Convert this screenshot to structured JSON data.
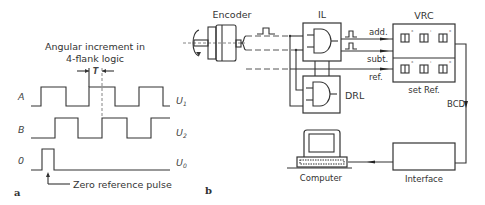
{
  "panel_a": {
    "label": "a",
    "title_line1": "Angular increment in",
    "title_line2": "4-flank logic",
    "period_label": "T",
    "signals": [
      {
        "name": "A",
        "output": "U",
        "output_sub": "1"
      },
      {
        "name": "B",
        "output": "U",
        "output_sub": "2"
      },
      {
        "name": "0",
        "output": "U",
        "output_sub": "0"
      }
    ],
    "zero_ref_label": "Zero reference pulse"
  },
  "panel_b": {
    "label": "b",
    "encoder_label": "Encoder",
    "il_label": "IL",
    "drl_label": "DRL",
    "vrc_label": "VRC",
    "add_label": "add.",
    "subt_label": "subt.",
    "ref_label": "ref.",
    "set_ref_label": "set Ref.",
    "bcd_label": "BCD",
    "computer_label": "Computer",
    "interface_label": "Interface",
    "display_units": [
      "°",
      "'",
      "\""
    ]
  }
}
